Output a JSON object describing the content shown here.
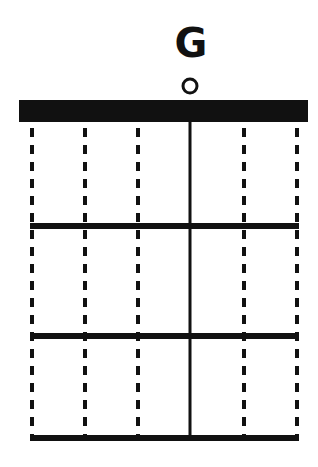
{
  "chord": {
    "name": "G",
    "strings": 6,
    "frets_shown": 3,
    "played_strings": [
      4
    ],
    "open_strings": [
      4
    ],
    "muted_style": "dashed",
    "fingered_notes": [],
    "colors": {
      "ink": "#111111",
      "background": "#ffffff"
    }
  }
}
